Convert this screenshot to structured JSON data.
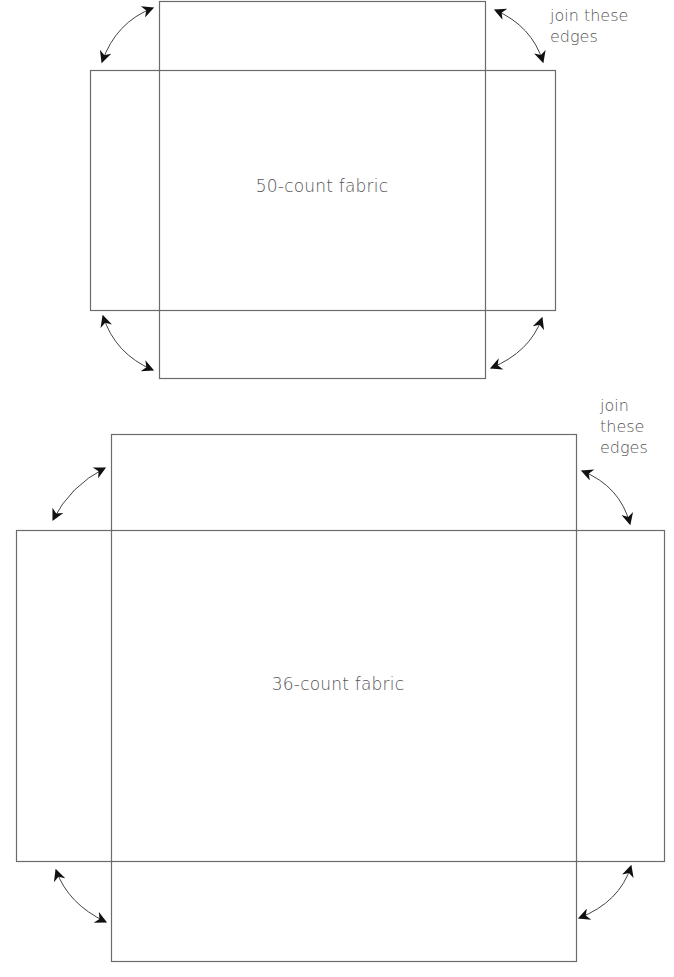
{
  "diagrams": [
    {
      "id": "top",
      "label": "50-count fabric",
      "note": [
        "join these",
        "edges"
      ],
      "note_layout": "two-line",
      "panel": {
        "x1": 159,
        "y1": 1,
        "x2": 485,
        "y2": 378
      },
      "band": {
        "x1": 90,
        "y1": 70,
        "x2": 555,
        "y2": 310
      }
    },
    {
      "id": "bottom",
      "label": "36-count fabric",
      "note": [
        "join",
        "these",
        "edges"
      ],
      "note_layout": "three-line",
      "panel": {
        "x1": 111,
        "y1": 434,
        "x2": 576,
        "y2": 961
      },
      "band": {
        "x1": 16,
        "y1": 530,
        "x2": 664,
        "y2": 861
      }
    }
  ],
  "colors": {
    "line": "#6b6b6b",
    "arrow": "#111111",
    "text": "#555555",
    "background": "#ffffff"
  }
}
